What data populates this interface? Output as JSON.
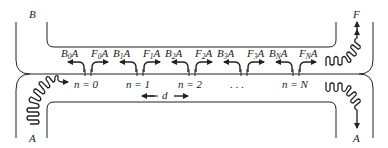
{
  "diagram": {
    "port_labels": {
      "top_left": "B",
      "bottom_left": "A",
      "top_right": "F",
      "bottom_right": "A"
    },
    "scatterers": [
      {
        "index_label": "n = 0",
        "backward": {
          "letter": "B",
          "sub": "0",
          "suffix": "A"
        },
        "forward": {
          "letter": "F",
          "sub": "0",
          "suffix": "A"
        }
      },
      {
        "index_label": "n = 1",
        "backward": {
          "letter": "B",
          "sub": "1",
          "suffix": "A"
        },
        "forward": {
          "letter": "F",
          "sub": "1",
          "suffix": "A"
        }
      },
      {
        "index_label": "n = 2",
        "backward": {
          "letter": "B",
          "sub": "2",
          "suffix": "A"
        },
        "forward": {
          "letter": "F",
          "sub": "2",
          "suffix": "A"
        }
      },
      {
        "index_label": ". . .",
        "backward": {
          "letter": "B",
          "sub": "3",
          "suffix": "A"
        },
        "forward": {
          "letter": "F",
          "sub": "3",
          "suffix": "A"
        }
      },
      {
        "index_label": "n = N",
        "backward": {
          "letter": "B",
          "sub": "N",
          "suffix": "A"
        },
        "forward": {
          "letter": "F",
          "sub": "N",
          "suffix": "A"
        }
      }
    ],
    "spacing_label": "d"
  }
}
